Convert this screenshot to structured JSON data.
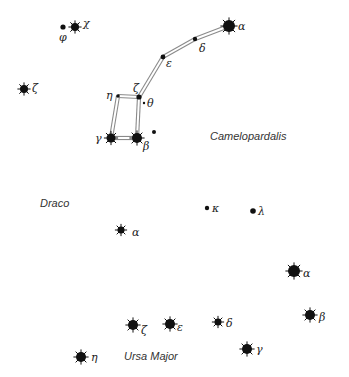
{
  "chart_data": {
    "type": "diagram",
    "title": "",
    "constellations": [
      {
        "name": "Camelopardalis",
        "x": 210,
        "y": 131
      },
      {
        "name": "Draco",
        "x": 40,
        "y": 198
      },
      {
        "name": "Ursa Major",
        "x": 124,
        "y": 351
      }
    ],
    "stars": [
      {
        "id": "umi-alpha",
        "label": "α",
        "x": 229,
        "y": 26,
        "r": 6,
        "rays": true,
        "lx": 238,
        "ly": 21
      },
      {
        "id": "umi-delta",
        "label": "δ",
        "x": 195,
        "y": 39,
        "r": 2.2,
        "rays": false,
        "lx": 199,
        "ly": 43
      },
      {
        "id": "umi-epsilon",
        "label": "ε",
        "x": 163,
        "y": 57,
        "r": 2.4,
        "rays": false,
        "lx": 166,
        "ly": 58
      },
      {
        "id": "umi-zeta",
        "label": "ζ",
        "x": 139,
        "y": 97,
        "r": 2.6,
        "rays": false,
        "lx": 133,
        "ly": 83
      },
      {
        "id": "umi-eta",
        "label": "η",
        "x": 118,
        "y": 96,
        "r": 1.8,
        "rays": false,
        "lx": 106,
        "ly": 90
      },
      {
        "id": "umi-theta",
        "label": "θ",
        "x": 144,
        "y": 103,
        "r": 1.2,
        "rays": false,
        "lx": 147,
        "ly": 98
      },
      {
        "id": "umi-gamma",
        "label": "γ",
        "x": 111,
        "y": 138,
        "r": 4.5,
        "rays": true,
        "lx": 95,
        "ly": 133
      },
      {
        "id": "umi-beta",
        "label": "β",
        "x": 137,
        "y": 138,
        "r": 5,
        "rays": true,
        "lx": 143,
        "ly": 141
      },
      {
        "id": "extra-dot",
        "label": "",
        "x": 154,
        "y": 132,
        "r": 2,
        "rays": false
      },
      {
        "id": "phi",
        "label": "φ",
        "x": 63,
        "y": 27,
        "r": 2.6,
        "rays": false,
        "lx": 59,
        "ly": 32
      },
      {
        "id": "chi",
        "label": "χ",
        "x": 75,
        "y": 27,
        "r": 4,
        "rays": true,
        "lx": 83,
        "ly": 18
      },
      {
        "id": "cam-zeta",
        "label": "ζ",
        "x": 24,
        "y": 89,
        "r": 4,
        "rays": true,
        "lx": 32,
        "ly": 83
      },
      {
        "id": "dra-alpha",
        "label": "α",
        "x": 121,
        "y": 230,
        "r": 3.5,
        "rays": true,
        "lx": 132,
        "ly": 227
      },
      {
        "id": "dra-kappa",
        "label": "κ",
        "x": 207,
        "y": 208,
        "r": 2.2,
        "rays": false,
        "lx": 212,
        "ly": 203
      },
      {
        "id": "dra-lambda",
        "label": "λ",
        "x": 253,
        "y": 211,
        "r": 2.8,
        "rays": false,
        "lx": 258,
        "ly": 206
      },
      {
        "id": "uma-alpha",
        "label": "α",
        "x": 294,
        "y": 271,
        "r": 6,
        "rays": true,
        "lx": 303,
        "ly": 268
      },
      {
        "id": "uma-beta",
        "label": "β",
        "x": 310,
        "y": 315,
        "r": 5,
        "rays": true,
        "lx": 319,
        "ly": 312
      },
      {
        "id": "uma-delta",
        "label": "δ",
        "x": 218,
        "y": 322,
        "r": 3.5,
        "rays": true,
        "lx": 226,
        "ly": 318
      },
      {
        "id": "uma-epsilon",
        "label": "ε",
        "x": 170,
        "y": 324,
        "r": 5,
        "rays": true,
        "lx": 177,
        "ly": 322
      },
      {
        "id": "uma-zeta",
        "label": "ζ",
        "x": 133,
        "y": 325,
        "r": 5,
        "rays": true,
        "lx": 141,
        "ly": 325
      },
      {
        "id": "uma-eta",
        "label": "η",
        "x": 81,
        "y": 357,
        "r": 5,
        "rays": true,
        "lx": 91,
        "ly": 352
      },
      {
        "id": "uma-gamma",
        "label": "γ",
        "x": 247,
        "y": 349,
        "r": 5,
        "rays": true,
        "lx": 256,
        "ly": 344
      }
    ],
    "lines": [
      [
        "umi-alpha",
        "umi-delta"
      ],
      [
        "umi-delta",
        "umi-epsilon"
      ],
      [
        "umi-epsilon",
        "umi-zeta"
      ],
      [
        "umi-zeta",
        "umi-eta"
      ],
      [
        "umi-zeta",
        "umi-beta"
      ],
      [
        "umi-eta",
        "umi-gamma"
      ],
      [
        "umi-gamma",
        "umi-beta"
      ]
    ],
    "colors": {
      "star": "#111111",
      "line_edge": "#8a8a8a",
      "line_fill": "#ffffff",
      "label": "#222222"
    }
  }
}
